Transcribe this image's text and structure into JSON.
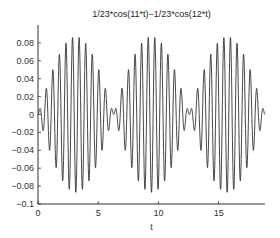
{
  "chart_data": {
    "type": "line",
    "title": "1/23*cos(11*t)−1/23*cos(12*t)",
    "xlabel": "t",
    "ylabel": "",
    "function": "1/23*cos(11*t)-1/23*cos(12*t)",
    "coef": 0.043478,
    "freq1": 11,
    "freq2": 12,
    "xlim": [
      0,
      18.85
    ],
    "ylim": [
      -0.1,
      0.1
    ],
    "xticks": [
      0,
      5,
      10,
      15
    ],
    "xtick_labels": [
      "0",
      "5",
      "10",
      "15"
    ],
    "yticks": [
      0.08,
      0.06,
      0.04,
      0.02,
      0,
      -0.02,
      -0.04,
      -0.06,
      -0.08,
      -0.1
    ],
    "ytick_labels": [
      "0.08",
      "0.06",
      "0.04",
      "0.02",
      "0",
      "−0.02",
      "−0.04",
      "−0.06",
      "−0.08",
      "−0.1"
    ],
    "grid": false,
    "legend": null,
    "envelope_peak": 0.087,
    "line_color": "#333333",
    "samples": 1200
  }
}
